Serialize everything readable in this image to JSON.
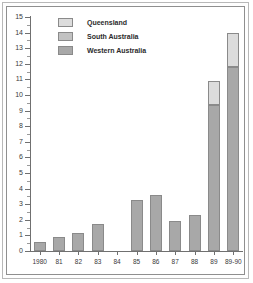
{
  "chart_data": {
    "type": "bar",
    "stacked": true,
    "title": "",
    "xlabel": "",
    "ylabel": "",
    "ylim": [
      0,
      15
    ],
    "ytick_step": 1,
    "minor_ticks": true,
    "grid": false,
    "legend_position": "top-left",
    "categories": [
      "1980",
      "81",
      "82",
      "83",
      "84",
      "85",
      "86",
      "87",
      "88",
      "89",
      "89-90"
    ],
    "ytick_labels": [
      "0",
      "1",
      "2",
      "3",
      "4",
      "5",
      "6",
      "7",
      "8",
      "9",
      "10",
      "11",
      "12",
      "13",
      "14",
      "15"
    ],
    "series": [
      {
        "name": "Western Australia",
        "color": "#a8a8a8",
        "values": [
          0.6,
          0.9,
          1.15,
          1.7,
          0,
          3.3,
          3.6,
          1.9,
          2.3,
          9.35,
          11.8
        ]
      },
      {
        "name": "South Australia",
        "color": "#c2c2c2",
        "values": [
          0,
          0,
          0,
          0,
          0,
          0,
          0,
          0,
          0,
          0,
          0
        ]
      },
      {
        "name": "Queensland",
        "color": "#dcdcdc",
        "values": [
          0,
          0,
          0,
          0,
          0,
          0,
          0,
          0,
          0,
          1.55,
          2.2
        ]
      }
    ],
    "totals": [
      0.6,
      0.9,
      1.15,
      1.7,
      0,
      3.3,
      3.6,
      1.9,
      2.3,
      10.9,
      14.0
    ]
  },
  "legend": {
    "items": [
      {
        "label": "Queensland",
        "color": "#dcdcdc"
      },
      {
        "label": "South Australia",
        "color": "#c2c2c2"
      },
      {
        "label": "Western Australia",
        "color": "#a8a8a8"
      }
    ]
  },
  "style": {
    "bar_border": "#8a8a8a",
    "axis_color": "#707070",
    "text_color": "#3a3a3a",
    "frame_color": "#8f8f8f",
    "background": "#ffffff"
  }
}
